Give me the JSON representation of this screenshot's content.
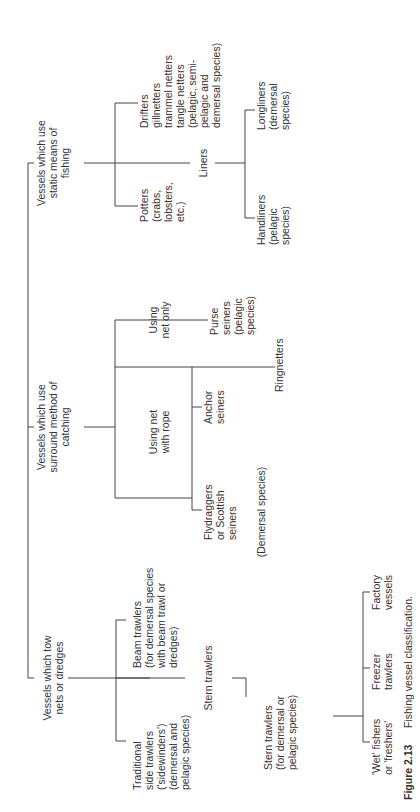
{
  "figure": {
    "number": "Figure 2.13",
    "caption": "Fishing vessel classification."
  },
  "root": {
    "categories": [
      {
        "id": "static",
        "lines": [
          "Vessels which use",
          "static means of",
          "fishing"
        ]
      },
      {
        "id": "surround",
        "lines": [
          "Vessels which use",
          "surround method of",
          "catching"
        ]
      },
      {
        "id": "tow",
        "lines": [
          "Vessels which tow",
          "nets or dredges"
        ]
      }
    ]
  },
  "static": {
    "potters": [
      "Potters",
      "(crabs,",
      "lobsters,",
      "etc.)"
    ],
    "liners": "Liners",
    "drifters": [
      "Drifters",
      "gillnetters",
      "trammel netters",
      "tangle netters",
      "(pelagic, semi-",
      "pelagic and",
      "demersal species)"
    ],
    "handliners": [
      "Handliners",
      "(pelagic",
      "species)"
    ],
    "longliners": [
      "Longliners",
      "(demersal",
      "species)"
    ]
  },
  "surround": {
    "rope": [
      "Using net",
      "with rope"
    ],
    "net_only": [
      "Using",
      "net only"
    ],
    "flydraggers": [
      "Flydraggers",
      "or Scottish",
      "seiners"
    ],
    "anchor": [
      "Anchor",
      "seiners"
    ],
    "demersal_note": "(Demersal species)",
    "ringnetters": "Ringnetters",
    "purse": [
      "Purse",
      "seiners",
      "(pelagic",
      "species)"
    ]
  },
  "tow": {
    "side": [
      "Traditional",
      "side trawlers",
      "('sidewinders')",
      "(demersal and",
      "pelagic species)"
    ],
    "beam": [
      "Beam trawlers",
      "(for demersal species",
      "with beam trawl or",
      "dredges)"
    ],
    "stern": "Stern trawlers",
    "stern_sub": [
      "Stern trawlers",
      "(for demersal or",
      "pelagic species)"
    ],
    "wet": [
      "'Wet' fishers",
      "or 'freshers'"
    ],
    "freezer": [
      "Freezer",
      "trawlers"
    ],
    "factory": [
      "Factory",
      "vessels"
    ]
  }
}
